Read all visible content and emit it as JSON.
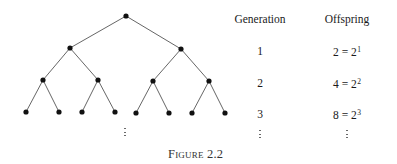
{
  "figure": {
    "caption": "Figure 2.2",
    "tree": {
      "levels": 4,
      "branching": 2,
      "nodes": [
        {
          "id": "n0",
          "x": 126,
          "y": 16
        },
        {
          "id": "n1",
          "x": 70,
          "y": 48
        },
        {
          "id": "n2",
          "x": 181,
          "y": 49
        },
        {
          "id": "n3",
          "x": 43,
          "y": 80
        },
        {
          "id": "n4",
          "x": 98,
          "y": 80
        },
        {
          "id": "n5",
          "x": 153,
          "y": 81
        },
        {
          "id": "n6",
          "x": 209,
          "y": 81
        },
        {
          "id": "n7",
          "x": 26,
          "y": 112
        },
        {
          "id": "n8",
          "x": 59,
          "y": 112
        },
        {
          "id": "n9",
          "x": 82,
          "y": 112
        },
        {
          "id": "n10",
          "x": 115,
          "y": 112
        },
        {
          "id": "n11",
          "x": 136,
          "y": 113
        },
        {
          "id": "n12",
          "x": 169,
          "y": 113
        },
        {
          "id": "n13",
          "x": 192,
          "y": 113
        },
        {
          "id": "n14",
          "x": 225,
          "y": 113
        }
      ],
      "edges": [
        [
          "n0",
          "n1"
        ],
        [
          "n0",
          "n2"
        ],
        [
          "n1",
          "n3"
        ],
        [
          "n1",
          "n4"
        ],
        [
          "n2",
          "n5"
        ],
        [
          "n2",
          "n6"
        ],
        [
          "n3",
          "n7"
        ],
        [
          "n3",
          "n8"
        ],
        [
          "n4",
          "n9"
        ],
        [
          "n4",
          "n10"
        ],
        [
          "n5",
          "n11"
        ],
        [
          "n5",
          "n12"
        ],
        [
          "n6",
          "n13"
        ],
        [
          "n6",
          "n14"
        ]
      ],
      "continuation": "⋮"
    },
    "table": {
      "headers": {
        "generation": "Generation",
        "offspring": "Offspring"
      },
      "rows": [
        {
          "generation": "1",
          "offspring_base": "2 = 2",
          "offspring_exp": "1"
        },
        {
          "generation": "2",
          "offspring_base": "4 = 2",
          "offspring_exp": "2"
        },
        {
          "generation": "3",
          "offspring_base": "8 = 2",
          "offspring_exp": "3"
        }
      ],
      "continuation": "⋮"
    },
    "colors": {
      "ink": "#1a1a1a",
      "edge": "#555555",
      "node": "#111111"
    }
  }
}
